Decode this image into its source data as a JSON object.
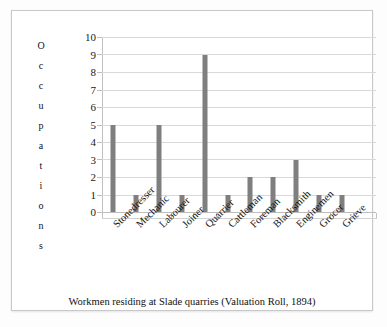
{
  "figure": {
    "caption": "Workmen residing at Slade quarries (Valuation Roll, 1894)",
    "y_axis_title_letters": [
      "O",
      "c",
      "c",
      "u",
      "p",
      "a",
      "t",
      "i",
      "o",
      "n",
      "s"
    ],
    "y_axis_title": "Occupations",
    "bar_color": "#7f7f7f",
    "gridline_color": "#d9d9d9",
    "frame_color": "#c8c8c8",
    "background": "#ffffff"
  },
  "chart_data": {
    "type": "bar",
    "title": "",
    "subtitle": "",
    "xlabel": "",
    "ylabel": "Occupations",
    "categories": [
      "Stonedresser",
      "Mechanic",
      "Labourer",
      "Joiner",
      "Quarrier",
      "Cattleman",
      "Foreman",
      "Blacksmith",
      "Enginemen",
      "Grocer",
      "Grieve"
    ],
    "values": [
      5,
      1,
      5,
      1,
      9,
      1,
      2,
      2,
      3,
      1,
      1
    ],
    "ylim": [
      0,
      10
    ],
    "ytick_labels": [
      "0",
      "1",
      "2",
      "3",
      "4",
      "5",
      "6",
      "7",
      "8",
      "9",
      "10"
    ],
    "ytick_values": [
      0,
      1,
      2,
      3,
      4,
      5,
      6,
      7,
      8,
      9,
      10
    ],
    "grid": true,
    "grid_axis": "y",
    "legend": false,
    "legend_position": "none",
    "annotation": "Workmen residing at Slade quarries (Valuation Roll, 1894)"
  }
}
